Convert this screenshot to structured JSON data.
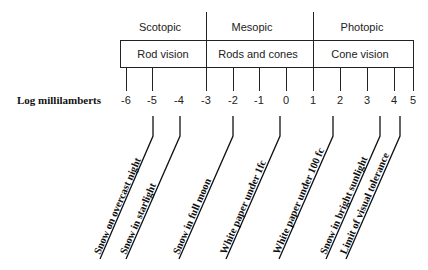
{
  "diagram": {
    "axis_label": "Log millilamberts",
    "regimes": [
      {
        "label": "Scotopic",
        "range": [
          -6,
          -3
        ]
      },
      {
        "label": "Mesopic",
        "range": [
          -3,
          1
        ]
      },
      {
        "label": "Photopic",
        "range": [
          1,
          5
        ]
      }
    ],
    "vision_types": [
      {
        "label": "Rod vision"
      },
      {
        "label": "Rods and cones"
      },
      {
        "label": "Cone vision"
      }
    ],
    "ticks": [
      "-6",
      "-5",
      "-4",
      "-3",
      "-2",
      "-1",
      "0",
      "1",
      "2",
      "3",
      "4",
      "5"
    ],
    "examples": [
      {
        "label": "Snow on overcast night",
        "value": -5
      },
      {
        "label": "Snow in starlight",
        "value": -4
      },
      {
        "label": "Snow in full moon",
        "value": -2
      },
      {
        "label": "White paper under 1fc",
        "value": 0
      },
      {
        "label": "White paper under 100 fc",
        "value": 2
      },
      {
        "label": "Snow in bright sunlight",
        "value": 3.6
      },
      {
        "label": "Limit of visual tolerance",
        "value": 4.4
      }
    ]
  }
}
